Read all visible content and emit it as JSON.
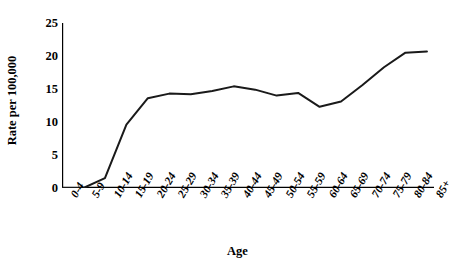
{
  "chart_data": {
    "type": "line",
    "title": "",
    "xlabel": "Age",
    "ylabel": "Rate per 100,000",
    "categories": [
      "0-4",
      "5-9",
      "10-14",
      "15-19",
      "20-24",
      "25-29",
      "30-34",
      "35-39",
      "40-44",
      "45-49",
      "50-54",
      "55-59",
      "60-64",
      "65-69",
      "70-74",
      "75-79",
      "80-84",
      "85+"
    ],
    "values": [
      0,
      0,
      1.5,
      9.6,
      13.6,
      14.3,
      14.2,
      14.7,
      15.4,
      14.9,
      14.0,
      14.4,
      12.3,
      13.1,
      15.6,
      18.3,
      20.5,
      20.7
    ],
    "series": [
      {
        "name": "Rate per 100,000",
        "values": [
          0,
          0,
          1.5,
          9.6,
          13.6,
          14.3,
          14.2,
          14.7,
          15.4,
          14.9,
          14.0,
          14.4,
          12.3,
          13.1,
          15.6,
          18.3,
          20.5,
          20.7
        ]
      }
    ],
    "ylim": [
      0,
      25
    ],
    "yticks": [
      0,
      5,
      10,
      15,
      20,
      25
    ],
    "ytick_labels": [
      "0",
      "5",
      "10",
      "15",
      "20",
      "25"
    ],
    "grid": false,
    "legend": false,
    "legend_position": "none",
    "line_color": "#1a1a1a",
    "background_color": "#ffffff"
  }
}
